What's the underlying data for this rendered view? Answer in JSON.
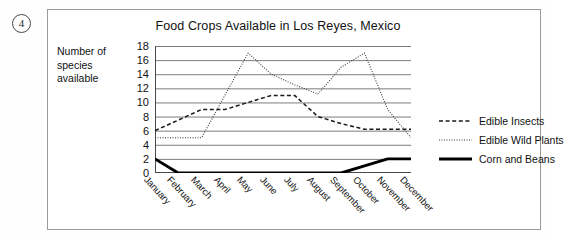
{
  "item_number": "4",
  "chart_data": {
    "type": "line",
    "title": "Food Crops Available in Los Reyes, Mexico",
    "ylabel": "Number of species available",
    "xlabel": "",
    "ylim": [
      0,
      18
    ],
    "y_ticks": [
      0,
      2,
      4,
      6,
      8,
      10,
      12,
      14,
      16,
      18
    ],
    "grid": true,
    "legend_position": "right",
    "categories": [
      "January",
      "February",
      "March",
      "April",
      "May",
      "June",
      "July",
      "August",
      "September",
      "October",
      "November",
      "December"
    ],
    "series": [
      {
        "name": "Edible Insects",
        "style": "dashed",
        "values": [
          6,
          7.5,
          9,
          9,
          10,
          11,
          11,
          8,
          7,
          6.2,
          6.2,
          6.2
        ]
      },
      {
        "name": "Edible Wild Plants",
        "style": "dotted",
        "values": [
          5,
          5,
          5,
          11,
          17,
          14,
          12.5,
          11.2,
          15,
          17,
          9,
          5
        ]
      },
      {
        "name": "Corn and Beans",
        "style": "solid-thick",
        "values": [
          2,
          0,
          0,
          0,
          0,
          0,
          0,
          0,
          0,
          1,
          2,
          2
        ]
      }
    ]
  },
  "legend": [
    {
      "label": "Edible Insects",
      "swatch": "dashed-line-swatch"
    },
    {
      "label": "Edible Wild Plants",
      "swatch": "dotted-line-swatch"
    },
    {
      "label": "Corn and Beans",
      "swatch": "solid-line-swatch"
    }
  ]
}
